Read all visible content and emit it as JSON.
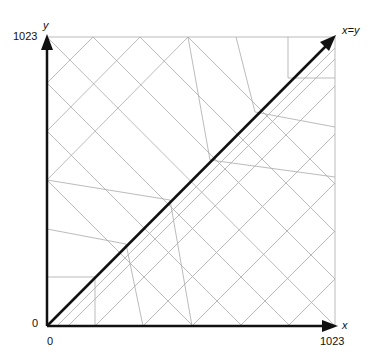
{
  "axes": {
    "x_label": "x",
    "y_label": "y",
    "diagonal_label": "x=y",
    "x_min_label": "0",
    "x_max_label": "1023",
    "y_min_label": "0",
    "y_max_label": "1023"
  },
  "colors": {
    "axis": "#111111",
    "grid": "#aaaaaa",
    "background": "#ffffff"
  },
  "frame": {
    "left": 47,
    "top": 37,
    "right": 335,
    "bottom": 326
  },
  "grid_lines": [
    [
      47,
      37,
      335,
      326
    ],
    [
      93,
      37,
      335,
      279
    ],
    [
      140,
      37,
      335,
      232
    ],
    [
      188,
      37,
      335,
      184
    ],
    [
      47,
      83,
      290,
      326
    ],
    [
      47,
      131,
      242,
      326
    ],
    [
      47,
      180,
      193,
      326
    ],
    [
      47,
      83,
      93,
      37
    ],
    [
      47,
      131,
      140,
      37
    ],
    [
      47,
      180,
      188,
      37
    ],
    [
      95,
      326,
      335,
      86
    ],
    [
      143,
      326,
      335,
      134
    ],
    [
      192,
      326,
      335,
      183
    ],
    [
      240,
      326,
      335,
      231
    ],
    [
      288,
      326,
      335,
      279
    ],
    [
      57,
      326,
      335,
      48
    ],
    [
      68,
      326,
      335,
      59
    ],
    [
      47,
      229,
      126,
      244
    ],
    [
      126,
      244,
      143,
      326
    ],
    [
      236,
      37,
      255,
      112
    ],
    [
      255,
      112,
      335,
      127
    ],
    [
      47,
      277,
      95,
      277
    ],
    [
      95,
      277,
      95,
      326
    ],
    [
      288,
      37,
      288,
      78
    ],
    [
      288,
      78,
      335,
      78
    ],
    [
      188,
      37,
      210,
      160
    ],
    [
      210,
      160,
      335,
      177
    ],
    [
      47,
      180,
      170,
      200
    ],
    [
      170,
      200,
      192,
      326
    ]
  ]
}
